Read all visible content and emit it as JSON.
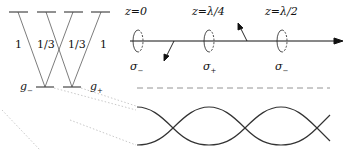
{
  "levels": {
    "transitions": [
      "1",
      "1/3",
      "1/3",
      "1"
    ],
    "ground": [
      "g_",
      "g+"
    ]
  },
  "ground_labels": {
    "minus": "g",
    "minus_sub": "−",
    "plus": "g",
    "plus_sub": "+"
  },
  "positions": [
    {
      "label": "z=0",
      "polarization": "σ",
      "sub": "−"
    },
    {
      "label": "z=λ/4",
      "polarization": "σ",
      "sub": "+"
    },
    {
      "label": "z=λ/2",
      "polarization": "σ",
      "sub": "−"
    }
  ],
  "colors": {
    "line": "#222222",
    "dotted": "#bbbbbb"
  }
}
